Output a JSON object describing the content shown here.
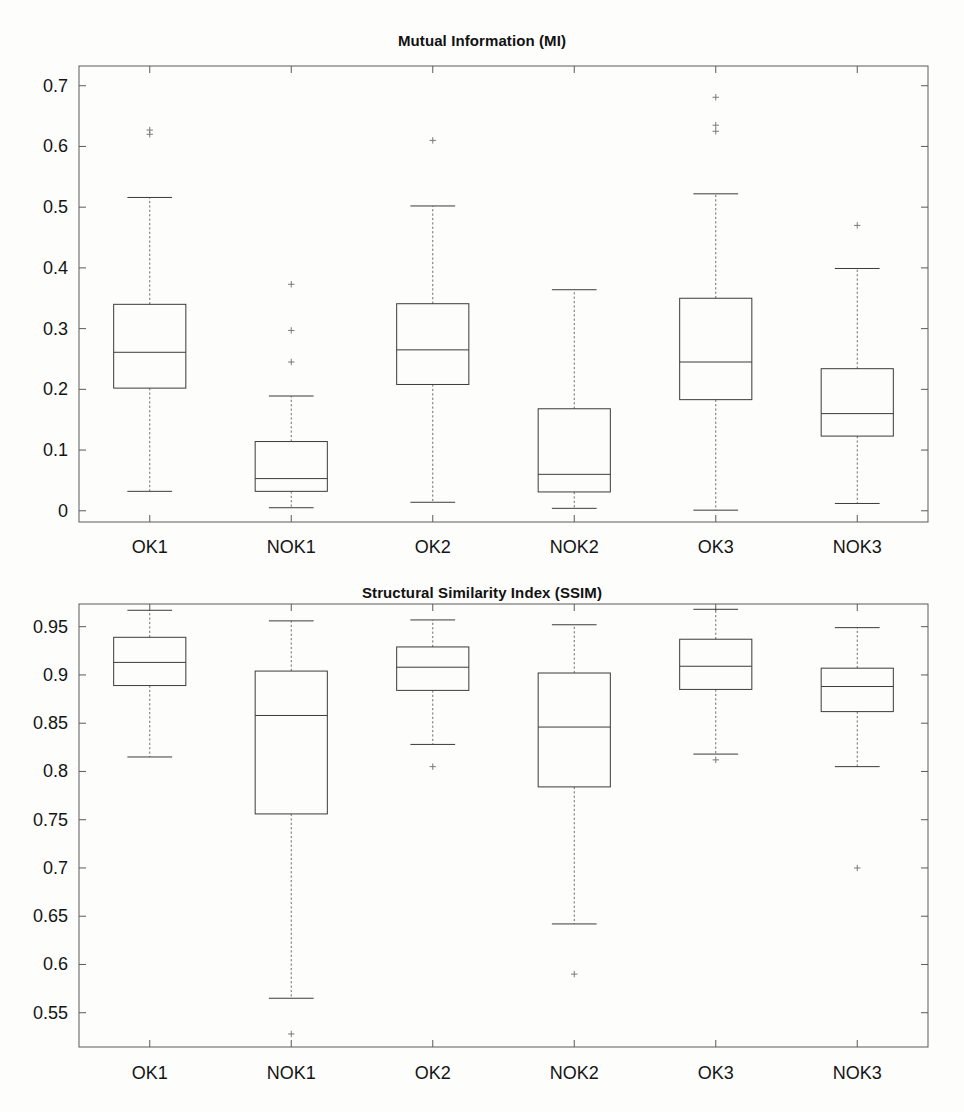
{
  "page": {
    "background": "#fdfdfc",
    "width": 964,
    "height": 1112
  },
  "figures": [
    {
      "id": "mi",
      "title": "Mutual Information (MI)"
    },
    {
      "id": "ssim",
      "title": "Structural Similarity Index (SSIM)"
    }
  ],
  "chart_data": [
    {
      "type": "box",
      "title": "Mutual Information (MI)",
      "xlabel": "",
      "ylabel": "",
      "ylim": [
        -0.02,
        0.72
      ],
      "grid": false,
      "legend": null,
      "categories": [
        "OK1",
        "NOK1",
        "OK2",
        "NOK2",
        "OK3",
        "NOK3"
      ],
      "ytick_labels": [
        "0",
        "0.1",
        "0.2",
        "0.3",
        "0.4",
        "0.5",
        "0.6",
        "0.7"
      ],
      "ytick_values": [
        0,
        0.1,
        0.2,
        0.3,
        0.4,
        0.5,
        0.6,
        0.7
      ],
      "boxes": [
        {
          "label": "OK1",
          "whisker_low": 0.032,
          "q1": 0.202,
          "median": 0.261,
          "q3": 0.34,
          "whisker_high": 0.516,
          "outliers": [
            0.62,
            0.627
          ]
        },
        {
          "label": "NOK1",
          "whisker_low": 0.005,
          "q1": 0.032,
          "median": 0.053,
          "q3": 0.114,
          "whisker_high": 0.189,
          "outliers": [
            0.245,
            0.297,
            0.373
          ]
        },
        {
          "label": "OK2",
          "whisker_low": 0.014,
          "q1": 0.208,
          "median": 0.265,
          "q3": 0.341,
          "whisker_high": 0.502,
          "outliers": [
            0.61
          ]
        },
        {
          "label": "NOK2",
          "whisker_low": 0.004,
          "q1": 0.031,
          "median": 0.06,
          "q3": 0.168,
          "whisker_high": 0.364,
          "outliers": []
        },
        {
          "label": "OK3",
          "whisker_low": 0.001,
          "q1": 0.183,
          "median": 0.245,
          "q3": 0.35,
          "whisker_high": 0.522,
          "outliers": [
            0.625,
            0.635,
            0.681
          ]
        },
        {
          "label": "NOK3",
          "whisker_low": 0.012,
          "q1": 0.123,
          "median": 0.16,
          "q3": 0.234,
          "whisker_high": 0.399,
          "outliers": [
            0.47
          ]
        }
      ]
    },
    {
      "type": "box",
      "title": "Structural Similarity Index (SSIM)",
      "xlabel": "",
      "ylabel": "",
      "ylim": [
        0.515,
        0.975
      ],
      "grid": false,
      "legend": null,
      "categories": [
        "OK1",
        "NOK1",
        "OK2",
        "NOK2",
        "OK3",
        "NOK3"
      ],
      "ytick_labels": [
        "0.55",
        "0.6",
        "0.65",
        "0.7",
        "0.75",
        "0.8",
        "0.85",
        "0.9",
        "0.95"
      ],
      "ytick_values": [
        0.55,
        0.6,
        0.65,
        0.7,
        0.75,
        0.8,
        0.85,
        0.9,
        0.95
      ],
      "boxes": [
        {
          "label": "OK1",
          "whisker_low": 0.815,
          "q1": 0.889,
          "median": 0.913,
          "q3": 0.939,
          "whisker_high": 0.967,
          "outliers": []
        },
        {
          "label": "NOK1",
          "whisker_low": 0.565,
          "q1": 0.756,
          "median": 0.858,
          "q3": 0.904,
          "whisker_high": 0.956,
          "outliers": [
            0.528
          ]
        },
        {
          "label": "OK2",
          "whisker_low": 0.828,
          "q1": 0.884,
          "median": 0.908,
          "q3": 0.929,
          "whisker_high": 0.957,
          "outliers": [
            0.805
          ]
        },
        {
          "label": "NOK2",
          "whisker_low": 0.642,
          "q1": 0.784,
          "median": 0.846,
          "q3": 0.902,
          "whisker_high": 0.952,
          "outliers": [
            0.59
          ]
        },
        {
          "label": "OK3",
          "whisker_low": 0.818,
          "q1": 0.885,
          "median": 0.909,
          "q3": 0.937,
          "whisker_high": 0.968,
          "outliers": [
            0.812
          ]
        },
        {
          "label": "NOK3",
          "whisker_low": 0.805,
          "q1": 0.862,
          "median": 0.888,
          "q3": 0.907,
          "whisker_high": 0.949,
          "outliers": [
            0.7
          ]
        }
      ]
    }
  ],
  "colors": {
    "box_stroke": "#3b3b3b",
    "whisker_stroke": "#6d6d6d",
    "axis_stroke": "#5a5a5a",
    "text": "#141414"
  }
}
